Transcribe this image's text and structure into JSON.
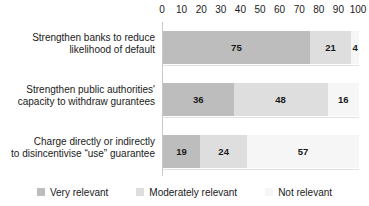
{
  "chart_data": {
    "type": "bar",
    "orientation": "horizontal",
    "stacked": true,
    "stack_mode": "percent",
    "title": "",
    "subtitle": "",
    "xlabel": "",
    "ylabel": "",
    "xlim": [
      0,
      100
    ],
    "xticks": [
      0,
      10,
      20,
      30,
      40,
      50,
      60,
      70,
      80,
      90,
      100
    ],
    "xtick_labels": [
      "0",
      "10",
      "20",
      "30",
      "40",
      "50",
      "60",
      "70",
      "80",
      "90",
      "100"
    ],
    "grid": false,
    "axis_position": "top",
    "legend_position": "bottom",
    "categories": [
      {
        "id": "strengthen-banks",
        "lines": [
          "Strengthen banks to reduce",
          "likelihood of default"
        ],
        "values": [
          75,
          21,
          4
        ],
        "labels": [
          "75",
          "21",
          "4"
        ]
      },
      {
        "id": "strengthen-public-authorities",
        "lines": [
          "Strengthen public authorities'",
          "capacity to withdraw gurantees"
        ],
        "values": [
          36,
          48,
          16
        ],
        "labels": [
          "36",
          "48",
          "16"
        ]
      },
      {
        "id": "charge-directly-or-indirectly",
        "lines": [
          "Charge directly or indirectly",
          "to disincentivise “use” guarantee"
        ],
        "values": [
          19,
          24,
          57
        ],
        "labels": [
          "19",
          "24",
          "57"
        ]
      }
    ],
    "series": [
      {
        "name": "Very relevant",
        "color": "#bdbdbd",
        "values": [
          75,
          36,
          19
        ]
      },
      {
        "name": "Moderately relevant",
        "color": "#dedede",
        "values": [
          21,
          48,
          24
        ]
      },
      {
        "name": "Not relevant",
        "color": "#f6f6f6",
        "values": [
          4,
          16,
          57
        ]
      }
    ],
    "legend": [
      {
        "label": "Very relevant",
        "color": "#bdbdbd"
      },
      {
        "label": "Moderately relevant",
        "color": "#dedede"
      },
      {
        "label": "Not relevant",
        "color": "#f6f6f6"
      }
    ],
    "colors": {
      "very_relevant": "#bdbdbd",
      "moderately_relevant": "#dedede",
      "not_relevant": "#f6f6f6",
      "axis_line": "#c9c9c9",
      "text": "#1a1a1a",
      "background": "#ffffff"
    }
  }
}
